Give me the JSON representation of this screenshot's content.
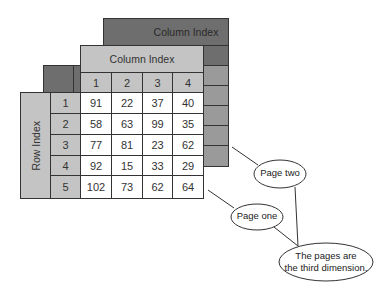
{
  "diagram": {
    "page_two": {
      "label": "Page two",
      "column_header": "Column Index"
    },
    "page_one": {
      "label": "Page one",
      "column_header": "Column Index",
      "row_header": "Row Index",
      "column_indices": [
        "1",
        "2",
        "3",
        "4"
      ],
      "row_indices": [
        "1",
        "2",
        "3",
        "4",
        "5"
      ],
      "values": [
        [
          "91",
          "22",
          "37",
          "40"
        ],
        [
          "58",
          "63",
          "99",
          "35"
        ],
        [
          "77",
          "81",
          "23",
          "62"
        ],
        [
          "92",
          "15",
          "33",
          "29"
        ],
        [
          "102",
          "73",
          "62",
          "64"
        ]
      ]
    },
    "callouts": {
      "page_two": "Page two",
      "page_one": "Page one",
      "third_dimension_line1": "The pages are",
      "third_dimension_line2": "the third dimension."
    },
    "colors": {
      "dark_gray": "#6e6e6e",
      "mid_gray": "#9a9a9a",
      "light_gray": "#c4c4c4",
      "border": "#333333"
    }
  }
}
